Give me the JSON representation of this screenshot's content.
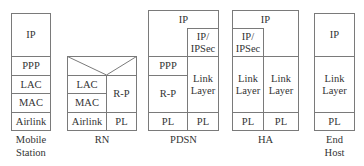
{
  "stacks": {
    "mobile_station": {
      "label_line1": "Mobile",
      "label_line2": "Station",
      "layers": [
        "IP",
        "PPP",
        "LAC",
        "MAC",
        "Airlink"
      ]
    },
    "rn": {
      "label": "RN",
      "left_layers": [
        "LAC",
        "MAC",
        "Airlink"
      ],
      "right_layers": [
        "R-P",
        "PL"
      ]
    },
    "pdsn": {
      "label": "PDSN",
      "top": "IP",
      "ipsec_line1": "IP/",
      "ipsec_line2": "IPSec",
      "left_layers": [
        "PPP",
        "R-P",
        "PL"
      ],
      "right_link_line1": "Link",
      "right_link_line2": "Layer",
      "right_pl": "PL"
    },
    "ha": {
      "label": "HA",
      "top": "IP",
      "ipsec_line1": "IP/",
      "ipsec_line2": "IPSec",
      "left_link_line1": "Link",
      "left_link_line2": "Layer",
      "right_link_line1": "Link",
      "right_link_line2": "Layer",
      "left_pl": "PL",
      "right_pl": "PL"
    },
    "end_host": {
      "label_line1": "End",
      "label_line2": "Host",
      "layers": [
        "IP",
        "PL"
      ],
      "link_line1": "Link",
      "link_line2": "Layer"
    }
  }
}
